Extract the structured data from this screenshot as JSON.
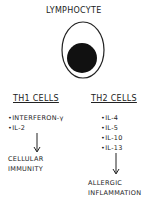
{
  "title": "LYMPHOCYTE",
  "th1": {
    "title": "TH1 CELLS",
    "items": [
      "•INTERFERON-γ",
      "•IL-2"
    ],
    "outcome": "CELLULAR IMMUNITY"
  },
  "th2": {
    "title": "TH2 CELLS",
    "items": [
      "•IL-4",
      "•IL-5",
      "•IL-10",
      "•IL-13"
    ],
    "outcome": "ALLERGIC INFLAMMATION"
  },
  "colors": {
    "ink": "#222222",
    "background": "#ffffff"
  }
}
